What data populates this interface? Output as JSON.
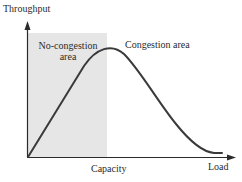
{
  "diagram": {
    "y_axis_label": "Throughput",
    "x_axis_label": "Load",
    "capacity_label": "Capacity",
    "regions": [
      {
        "label_line1": "No-congestion",
        "label_line2": "area",
        "shaded": true,
        "fill": "#e6e6e6"
      },
      {
        "label": "Congestion area",
        "shaded": false
      }
    ],
    "colors": {
      "axis": "#2b2b2b",
      "curve": "#3a3a3a",
      "shade": "#e6e6e6",
      "background": "#ffffff"
    },
    "curve_description": "Throughput rises linearly with load in the no-congestion area, peaks near capacity, then falls toward zero in the congestion area"
  }
}
